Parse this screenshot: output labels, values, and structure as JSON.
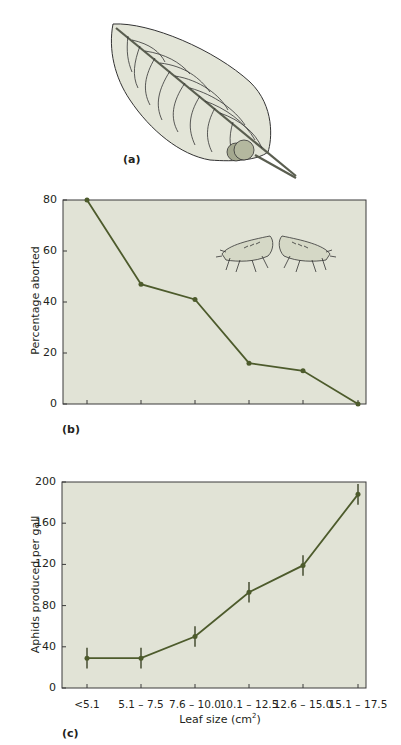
{
  "panels": {
    "a": {
      "label": "(a)",
      "illustration": "leaf-with-aphid-gall"
    },
    "b": {
      "label": "(b)",
      "illustration": "two-aphids-fighting"
    },
    "c": {
      "label": "(c)"
    }
  },
  "colors": {
    "plot_bg": "#e1e3d6",
    "line": "#4d5b2c",
    "axis": "#3a3a3a",
    "leaf_fill": "#e3e5d8",
    "gall_fill": "#a4a88f"
  },
  "chart_data": [
    {
      "id": "b",
      "type": "line",
      "title": "",
      "xlabel": "",
      "ylabel": "Percentage aborted",
      "categories": [
        "<5.1",
        "5.1 – 7.5",
        "7.6 – 10.0",
        "10.1 – 12.5",
        "12.6 – 15.0",
        "15.1 – 17.5"
      ],
      "values": [
        80,
        47,
        41,
        16,
        13,
        0
      ],
      "ylim": [
        0,
        80
      ],
      "yticks": [
        "0",
        "20",
        "40",
        "60",
        "80"
      ],
      "grid": false,
      "legend": null
    },
    {
      "id": "c",
      "type": "line",
      "title": "",
      "xlabel": "Leaf size (cm²)",
      "xlabel_base": "Leaf size (cm",
      "xlabel_sup": "2",
      "xlabel_end": ")",
      "ylabel": "Aphids produced per gall",
      "categories": [
        "<5.1",
        "5.1 – 7.5",
        "7.6 – 10.0",
        "10.1 – 12.5",
        "12.6 – 15.0",
        "15.1 – 17.5"
      ],
      "values": [
        29,
        29,
        50,
        93,
        119,
        188
      ],
      "error": [
        10,
        10,
        10,
        10,
        10,
        10
      ],
      "ylim": [
        0,
        200
      ],
      "yticks": [
        "0",
        "40",
        "80",
        "120",
        "160",
        "200"
      ],
      "grid": false,
      "legend": null
    }
  ]
}
